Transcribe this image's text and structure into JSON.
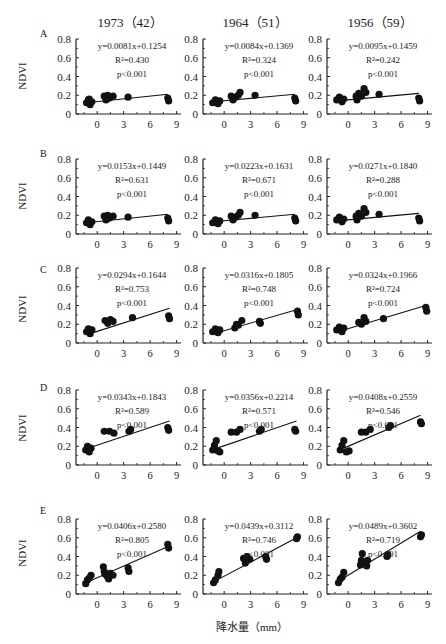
{
  "figure": {
    "y_axis_label": "NDVI",
    "x_axis_label": "降水量（mm）",
    "column_titles": [
      "1973（42）",
      "1964（51）",
      "1956（59）"
    ],
    "row_labels": [
      "A",
      "B",
      "C",
      "D",
      "E"
    ]
  },
  "chart_data": {
    "type": "scatter",
    "layout": "5 rows × 3 columns small-multiple scatter plots with linear regression lines",
    "xlabel": "降水量（mm）",
    "ylabel": "NDVI",
    "x_ticks": [
      0,
      3,
      6,
      9
    ],
    "y_ticks": [
      0,
      0.2,
      0.4,
      0.6,
      0.8
    ],
    "xlim": [
      -2.4,
      9.5
    ],
    "ylim": [
      0,
      0.8
    ],
    "columns": [
      "1973（42）",
      "1964（51）",
      "1956（59）"
    ],
    "rows": [
      "A",
      "B",
      "C",
      "D",
      "E"
    ],
    "panels": [
      {
        "row": "A",
        "col": "1973（42）",
        "equation": "y=0.0081x+0.1254",
        "r2": "R²=0.430",
        "p": "p<0.001",
        "slope": 0.0081,
        "intercept": 0.1254,
        "points": [
          [
            -1.2,
            0.12
          ],
          [
            -1.0,
            0.15
          ],
          [
            -0.8,
            0.1
          ],
          [
            -0.6,
            0.13
          ],
          [
            -0.9,
            0.16
          ],
          [
            0.8,
            0.19
          ],
          [
            1.0,
            0.15
          ],
          [
            1.2,
            0.2
          ],
          [
            1.4,
            0.17
          ],
          [
            1.8,
            0.19
          ],
          [
            3.5,
            0.18
          ],
          [
            8.0,
            0.17
          ],
          [
            8.1,
            0.14
          ]
        ],
        "line": [
          [
            -1.2,
            0.12
          ],
          [
            8.0,
            0.21
          ]
        ]
      },
      {
        "row": "A",
        "col": "1964（51）",
        "equation": "y=0.0084x+0.1369",
        "r2": "R²=0.324",
        "p": "p<0.001",
        "slope": 0.0084,
        "intercept": 0.1369,
        "points": [
          [
            -1.3,
            0.12
          ],
          [
            -1.0,
            0.15
          ],
          [
            -0.7,
            0.11
          ],
          [
            -0.5,
            0.14
          ],
          [
            0.8,
            0.19
          ],
          [
            1.0,
            0.15
          ],
          [
            1.3,
            0.18
          ],
          [
            1.6,
            0.2
          ],
          [
            1.8,
            0.23
          ],
          [
            3.5,
            0.2
          ],
          [
            8.0,
            0.17
          ],
          [
            8.1,
            0.14
          ]
        ],
        "line": [
          [
            -1.3,
            0.13
          ],
          [
            8.0,
            0.21
          ]
        ]
      },
      {
        "row": "A",
        "col": "1956（59）",
        "equation": "y=0.0095x+0.1459",
        "r2": "R²=0.242",
        "p": "p<0.001",
        "slope": 0.0095,
        "intercept": 0.1459,
        "points": [
          [
            -1.3,
            0.15
          ],
          [
            -1.0,
            0.18
          ],
          [
            -0.7,
            0.13
          ],
          [
            -0.5,
            0.16
          ],
          [
            0.9,
            0.19
          ],
          [
            1.0,
            0.15
          ],
          [
            1.2,
            0.22
          ],
          [
            1.5,
            0.19
          ],
          [
            1.8,
            0.27
          ],
          [
            2.0,
            0.23
          ],
          [
            3.5,
            0.21
          ],
          [
            8.0,
            0.17
          ],
          [
            8.1,
            0.14
          ]
        ],
        "line": [
          [
            -1.3,
            0.14
          ],
          [
            8.0,
            0.22
          ]
        ]
      },
      {
        "row": "B",
        "col": "1973（42）",
        "equation": "y=0.0153x+0.1449",
        "r2": "R²=0.631",
        "p": "p<0.001",
        "slope": 0.0153,
        "intercept": 0.1449,
        "points": [
          [
            -1.2,
            0.12
          ],
          [
            -1.0,
            0.15
          ],
          [
            -0.8,
            0.1
          ],
          [
            -0.6,
            0.13
          ],
          [
            0.8,
            0.19
          ],
          [
            1.0,
            0.15
          ],
          [
            1.2,
            0.2
          ],
          [
            1.4,
            0.17
          ],
          [
            1.8,
            0.19
          ],
          [
            3.5,
            0.18
          ],
          [
            8.0,
            0.17
          ],
          [
            8.1,
            0.14
          ]
        ],
        "line": [
          [
            -1.2,
            0.12
          ],
          [
            8.0,
            0.21
          ]
        ]
      },
      {
        "row": "B",
        "col": "1964（51）",
        "equation": "y=0.0223x+0.1631",
        "r2": "R²=0.671",
        "p": "p<0.001",
        "slope": 0.0223,
        "intercept": 0.1631,
        "points": [
          [
            -1.3,
            0.12
          ],
          [
            -1.0,
            0.15
          ],
          [
            -0.7,
            0.11
          ],
          [
            -0.5,
            0.14
          ],
          [
            0.8,
            0.19
          ],
          [
            1.0,
            0.15
          ],
          [
            1.3,
            0.18
          ],
          [
            1.6,
            0.2
          ],
          [
            1.8,
            0.23
          ],
          [
            3.5,
            0.2
          ],
          [
            8.0,
            0.17
          ],
          [
            8.1,
            0.14
          ]
        ],
        "line": [
          [
            -1.3,
            0.13
          ],
          [
            8.0,
            0.21
          ]
        ]
      },
      {
        "row": "B",
        "col": "1956（59）",
        "equation": "y=0.0271x+0.1840",
        "r2": "R²=0.288",
        "p": "p<0.001",
        "slope": 0.0271,
        "intercept": 0.184,
        "points": [
          [
            -1.3,
            0.15
          ],
          [
            -1.0,
            0.18
          ],
          [
            -0.7,
            0.13
          ],
          [
            -0.5,
            0.16
          ],
          [
            0.9,
            0.19
          ],
          [
            1.0,
            0.15
          ],
          [
            1.2,
            0.22
          ],
          [
            1.5,
            0.19
          ],
          [
            1.8,
            0.27
          ],
          [
            2.0,
            0.23
          ],
          [
            3.5,
            0.21
          ],
          [
            8.0,
            0.17
          ],
          [
            8.1,
            0.14
          ]
        ],
        "line": [
          [
            -1.3,
            0.14
          ],
          [
            8.0,
            0.22
          ]
        ]
      },
      {
        "row": "C",
        "col": "1973（42）",
        "equation": "y=0.0294x+0.1644",
        "r2": "R²=0.753",
        "p": "p<0.001",
        "slope": 0.0294,
        "intercept": 0.1644,
        "points": [
          [
            -1.2,
            0.12
          ],
          [
            -1.0,
            0.15
          ],
          [
            -0.8,
            0.1
          ],
          [
            -0.6,
            0.14
          ],
          [
            0.9,
            0.24
          ],
          [
            1.2,
            0.21
          ],
          [
            1.5,
            0.25
          ],
          [
            1.8,
            0.23
          ],
          [
            4.0,
            0.27
          ],
          [
            8.1,
            0.29
          ],
          [
            8.2,
            0.26
          ]
        ],
        "line": [
          [
            -0.8,
            0.1
          ],
          [
            8.2,
            0.37
          ]
        ]
      },
      {
        "row": "C",
        "col": "1964（51）",
        "equation": "y=0.0316x+0.1805",
        "r2": "R²=0.748",
        "p": "p<0.001",
        "slope": 0.0316,
        "intercept": 0.1805,
        "points": [
          [
            -1.3,
            0.12
          ],
          [
            -1.0,
            0.15
          ],
          [
            -0.7,
            0.11
          ],
          [
            -0.5,
            0.14
          ],
          [
            1.2,
            0.16
          ],
          [
            1.4,
            0.2
          ],
          [
            1.6,
            0.19
          ],
          [
            2.0,
            0.24
          ],
          [
            4.0,
            0.23
          ],
          [
            4.1,
            0.21
          ],
          [
            8.3,
            0.34
          ],
          [
            8.4,
            0.3
          ]
        ],
        "line": [
          [
            -0.8,
            0.11
          ],
          [
            8.4,
            0.36
          ]
        ]
      },
      {
        "row": "C",
        "col": "1956（59）",
        "equation": "y=0.0324x+0.1966",
        "r2": "R²=0.724",
        "p": "p<0.001",
        "slope": 0.0324,
        "intercept": 0.1966,
        "points": [
          [
            -1.3,
            0.14
          ],
          [
            -1.0,
            0.17
          ],
          [
            -0.7,
            0.12
          ],
          [
            -0.5,
            0.16
          ],
          [
            1.2,
            0.22
          ],
          [
            1.5,
            0.2
          ],
          [
            1.8,
            0.27
          ],
          [
            2.0,
            0.23
          ],
          [
            4.0,
            0.26
          ],
          [
            8.8,
            0.38
          ],
          [
            8.9,
            0.34
          ]
        ],
        "line": [
          [
            -0.8,
            0.13
          ],
          [
            8.8,
            0.4
          ]
        ]
      },
      {
        "row": "D",
        "col": "1973（42）",
        "equation": "y=0.0343x+0.1843",
        "r2": "R²=0.589",
        "p": "p<0.001",
        "slope": 0.0343,
        "intercept": 0.1843,
        "points": [
          [
            -1.3,
            0.16
          ],
          [
            -1.1,
            0.2
          ],
          [
            -0.9,
            0.14
          ],
          [
            -0.7,
            0.18
          ],
          [
            0.8,
            0.36
          ],
          [
            1.4,
            0.36
          ],
          [
            1.9,
            0.34
          ],
          [
            3.6,
            0.36
          ],
          [
            3.8,
            0.38
          ],
          [
            8.0,
            0.4
          ],
          [
            8.1,
            0.37
          ]
        ],
        "line": [
          [
            -0.7,
            0.19
          ],
          [
            8.2,
            0.47
          ]
        ]
      },
      {
        "row": "D",
        "col": "1964（51）",
        "equation": "y=0.0356x+0.2214",
        "r2": "R²=0.571",
        "p": "p<0.001",
        "slope": 0.0356,
        "intercept": 0.2214,
        "points": [
          [
            -1.3,
            0.16
          ],
          [
            -1.1,
            0.21
          ],
          [
            -0.9,
            0.26
          ],
          [
            -0.7,
            0.15
          ],
          [
            -0.5,
            0.14
          ],
          [
            0.8,
            0.35
          ],
          [
            1.4,
            0.35
          ],
          [
            1.8,
            0.38
          ],
          [
            4.0,
            0.36
          ],
          [
            4.2,
            0.38
          ],
          [
            8.0,
            0.38
          ],
          [
            8.1,
            0.36
          ]
        ],
        "line": [
          [
            -0.8,
            0.18
          ],
          [
            8.2,
            0.47
          ]
        ]
      },
      {
        "row": "D",
        "col": "1956（59）",
        "equation": "y=0.0408x+0.2559",
        "r2": "R²=0.546",
        "p": "p<0.001",
        "slope": 0.0408,
        "intercept": 0.2559,
        "points": [
          [
            -0.9,
            0.16
          ],
          [
            -0.7,
            0.21
          ],
          [
            -0.5,
            0.26
          ],
          [
            -0.2,
            0.14
          ],
          [
            0.1,
            0.15
          ],
          [
            1.5,
            0.35
          ],
          [
            2.0,
            0.35
          ],
          [
            2.5,
            0.38
          ],
          [
            4.6,
            0.4
          ],
          [
            4.8,
            0.42
          ],
          [
            8.2,
            0.46
          ],
          [
            8.3,
            0.44
          ]
        ],
        "line": [
          [
            -0.5,
            0.18
          ],
          [
            8.2,
            0.53
          ]
        ]
      },
      {
        "row": "E",
        "col": "1973（42）",
        "equation": "y=0.0406x+0.2580",
        "r2": "R²=0.805",
        "p": "p<0.001",
        "slope": 0.0406,
        "intercept": 0.258,
        "points": [
          [
            -1.3,
            0.11
          ],
          [
            -1.1,
            0.15
          ],
          [
            -0.9,
            0.17
          ],
          [
            -0.7,
            0.2
          ],
          [
            0.7,
            0.29
          ],
          [
            0.8,
            0.24
          ],
          [
            0.9,
            0.21
          ],
          [
            1.2,
            0.18
          ],
          [
            1.3,
            0.16
          ],
          [
            1.5,
            0.22
          ],
          [
            1.8,
            0.2
          ],
          [
            3.5,
            0.28
          ],
          [
            3.6,
            0.24
          ],
          [
            8.0,
            0.53
          ],
          [
            8.1,
            0.49
          ]
        ],
        "line": [
          [
            -1.3,
            0.12
          ],
          [
            8.1,
            0.51
          ]
        ]
      },
      {
        "row": "E",
        "col": "1964（51）",
        "equation": "y=0.0439x+0.3112",
        "r2": "R²=0.746",
        "p": "p<0.001",
        "slope": 0.0439,
        "intercept": 0.3112,
        "points": [
          [
            -1.2,
            0.12
          ],
          [
            -1.0,
            0.15
          ],
          [
            -0.7,
            0.2
          ],
          [
            -0.6,
            0.24
          ],
          [
            2.2,
            0.38
          ],
          [
            2.4,
            0.33
          ],
          [
            2.6,
            0.4
          ],
          [
            2.9,
            0.37
          ],
          [
            4.7,
            0.4
          ],
          [
            4.8,
            0.37
          ],
          [
            8.2,
            0.59
          ],
          [
            8.3,
            0.61
          ]
        ],
        "line": [
          [
            -1.0,
            0.14
          ],
          [
            8.2,
            0.6
          ]
        ]
      },
      {
        "row": "E",
        "col": "1956（59）",
        "equation": "y=0.0489x+0.3602",
        "r2": "R²=0.719",
        "p": "p<0.001",
        "slope": 0.0489,
        "intercept": 0.3602,
        "points": [
          [
            -1.1,
            0.12
          ],
          [
            -0.9,
            0.16
          ],
          [
            -0.7,
            0.18
          ],
          [
            -0.5,
            0.23
          ],
          [
            1.4,
            0.31
          ],
          [
            1.5,
            0.36
          ],
          [
            1.6,
            0.43
          ],
          [
            1.9,
            0.33
          ],
          [
            2.1,
            0.3
          ],
          [
            2.2,
            0.36
          ],
          [
            4.4,
            0.4
          ],
          [
            4.5,
            0.42
          ],
          [
            8.2,
            0.61
          ],
          [
            8.3,
            0.63
          ]
        ],
        "line": [
          [
            -0.9,
            0.15
          ],
          [
            8.2,
            0.67
          ]
        ]
      }
    ]
  }
}
